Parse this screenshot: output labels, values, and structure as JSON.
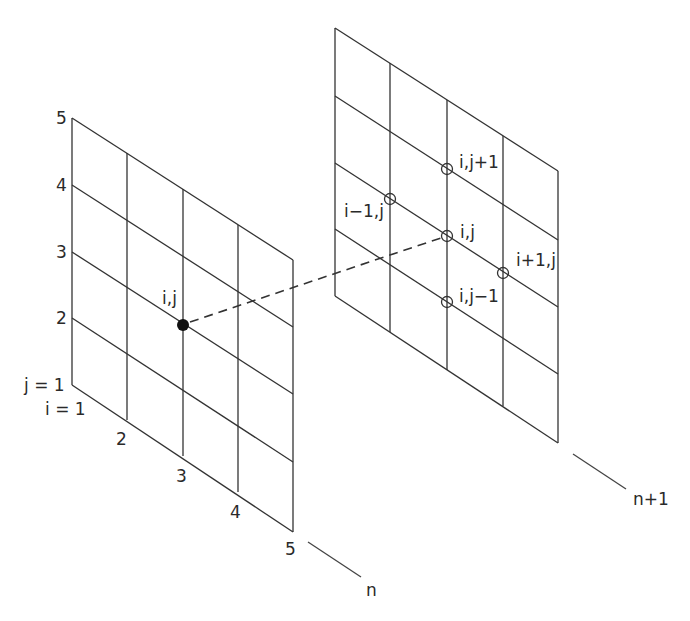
{
  "diagram": {
    "left_grid": {
      "level_label": "n",
      "j_labels": [
        "j = 1",
        "2",
        "3",
        "4",
        "5"
      ],
      "i_labels": [
        "i = 1",
        "2",
        "3",
        "4",
        "5"
      ],
      "point_label": "i,j",
      "point_style": "filled"
    },
    "right_grid": {
      "level_label": "n+1",
      "points": [
        {
          "label": "i,j+1",
          "style": "open"
        },
        {
          "label": "i−1,j",
          "style": "open"
        },
        {
          "label": "i,j",
          "style": "open"
        },
        {
          "label": "i+1,j",
          "style": "open"
        },
        {
          "label": "i,j−1",
          "style": "open"
        }
      ]
    },
    "connector": "dashed line from (i,j) at level n to (i,j) at level n+1",
    "colors": {
      "line": "#333333",
      "text": "#2a2a2a",
      "background": "#ffffff"
    }
  }
}
